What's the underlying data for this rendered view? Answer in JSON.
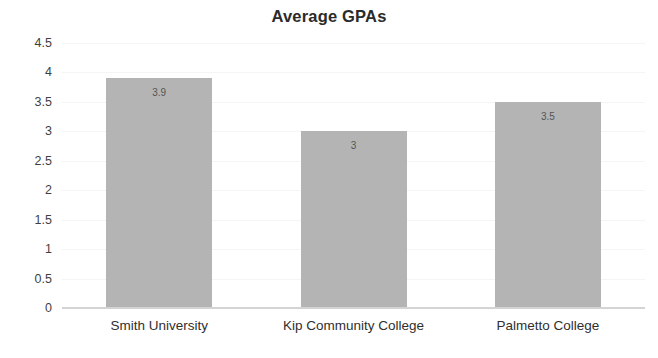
{
  "chart_data": {
    "type": "bar",
    "title": "Average GPAs",
    "xlabel": "",
    "ylabel": "",
    "categories": [
      "Smith University",
      "Kip Community College",
      "Palmetto College"
    ],
    "values": [
      3.9,
      3,
      3.5
    ],
    "value_labels": [
      "3.9",
      "3",
      "3.5"
    ],
    "ylim": [
      0,
      4.5
    ],
    "ytick_labels": [
      "4.5",
      "4",
      "3.5",
      "3",
      "2.5",
      "2",
      "1.5",
      "1",
      "0.5",
      "0"
    ],
    "ytick_values": [
      4.5,
      4,
      3.5,
      3,
      2.5,
      2,
      1.5,
      1,
      0.5,
      0
    ],
    "grid": true,
    "legend": false,
    "legend_position": "none",
    "series": [
      {
        "name": "Average GPA",
        "values": [
          3.9,
          3,
          3.5
        ]
      }
    ],
    "colors": {
      "bar": "#b4b4b4",
      "title": "#2b2b2b",
      "tick_label": "#3f3f3f",
      "category_label": "#2f2f2f",
      "value_label": "#555555",
      "gridline": "#f4f5f6",
      "axis_line": "#d4d4d4",
      "background": "#ffffff"
    }
  }
}
